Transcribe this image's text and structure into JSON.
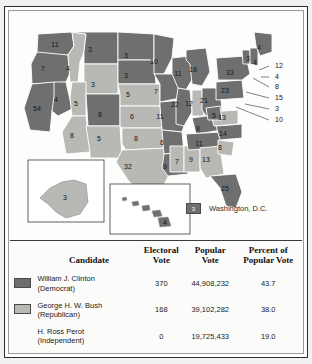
{
  "map": {
    "title": "1992 United States presidential election results map",
    "colors": {
      "democrat": "#6f6f6f",
      "republican": "#b8b8b4",
      "border": "#ffffff",
      "outline": "#6b6b6b",
      "background": "#fdfdfc"
    },
    "legend": {
      "swatch_value": "3",
      "label": "Washington, D.C.",
      "party": "democrat"
    },
    "insets": [
      {
        "name": "alaska",
        "value": "3",
        "party": "republican"
      },
      {
        "name": "hawaii",
        "value": "4",
        "party": "democrat"
      }
    ],
    "states": [
      {
        "code": "WA",
        "value": "11",
        "party": "democrat",
        "x": 45,
        "y": 33
      },
      {
        "code": "OR",
        "value": "7",
        "party": "democrat",
        "x": 33,
        "y": 57
      },
      {
        "code": "CA",
        "value": "54",
        "party": "democrat",
        "x": 27,
        "y": 97
      },
      {
        "code": "NV",
        "value": "4",
        "party": "democrat",
        "x": 46,
        "y": 88
      },
      {
        "code": "ID",
        "value": "4",
        "party": "republican",
        "x": 58,
        "y": 57
      },
      {
        "code": "MT",
        "value": "3",
        "party": "democrat",
        "x": 80,
        "y": 38
      },
      {
        "code": "WY",
        "value": "3",
        "party": "republican",
        "x": 83,
        "y": 73
      },
      {
        "code": "UT",
        "value": "5",
        "party": "republican",
        "x": 66,
        "y": 92
      },
      {
        "code": "AZ",
        "value": "8",
        "party": "republican",
        "x": 62,
        "y": 124
      },
      {
        "code": "CO",
        "value": "8",
        "party": "democrat",
        "x": 90,
        "y": 103
      },
      {
        "code": "NM",
        "value": "5",
        "party": "republican",
        "x": 89,
        "y": 127
      },
      {
        "code": "ND",
        "value": "3",
        "party": "democrat",
        "x": 116,
        "y": 44
      },
      {
        "code": "SD",
        "value": "3",
        "party": "democrat",
        "x": 116,
        "y": 64
      },
      {
        "code": "NE",
        "value": "5",
        "party": "republican",
        "x": 118,
        "y": 83
      },
      {
        "code": "KS",
        "value": "6",
        "party": "republican",
        "x": 122,
        "y": 105
      },
      {
        "code": "OK",
        "value": "8",
        "party": "republican",
        "x": 126,
        "y": 127
      },
      {
        "code": "TX",
        "value": "32",
        "party": "republican",
        "x": 118,
        "y": 155
      },
      {
        "code": "MN",
        "value": "10",
        "party": "democrat",
        "x": 144,
        "y": 50
      },
      {
        "code": "IA",
        "value": "7",
        "party": "democrat",
        "x": 146,
        "y": 80
      },
      {
        "code": "MO",
        "value": "11",
        "party": "democrat",
        "x": 150,
        "y": 105
      },
      {
        "code": "AR",
        "value": "6",
        "party": "democrat",
        "x": 152,
        "y": 131
      },
      {
        "code": "LA",
        "value": "9",
        "party": "democrat",
        "x": 155,
        "y": 155
      },
      {
        "code": "WI",
        "value": "11",
        "party": "democrat",
        "x": 168,
        "y": 62
      },
      {
        "code": "IL",
        "value": "22",
        "party": "democrat",
        "x": 165,
        "y": 93
      },
      {
        "code": "MS",
        "value": "7",
        "party": "republican",
        "x": 167,
        "y": 150
      },
      {
        "code": "AL",
        "value": "9",
        "party": "republican",
        "x": 181,
        "y": 148
      },
      {
        "code": "MI",
        "value": "18",
        "party": "democrat",
        "x": 183,
        "y": 58
      },
      {
        "code": "IN",
        "value": "12",
        "party": "republican",
        "x": 179,
        "y": 92
      },
      {
        "code": "OH",
        "value": "21",
        "party": "democrat",
        "x": 194,
        "y": 89
      },
      {
        "code": "KY",
        "value": "8",
        "party": "democrat",
        "x": 188,
        "y": 117
      },
      {
        "code": "TN",
        "value": "11",
        "party": "democrat",
        "x": 189,
        "y": 132
      },
      {
        "code": "GA",
        "value": "13",
        "party": "republican",
        "x": 196,
        "y": 148
      },
      {
        "code": "FL",
        "value": "25",
        "party": "democrat",
        "x": 215,
        "y": 177
      },
      {
        "code": "SC",
        "value": "8",
        "party": "republican",
        "x": 210,
        "y": 136
      },
      {
        "code": "NC",
        "value": "14",
        "party": "democrat",
        "x": 213,
        "y": 122
      },
      {
        "code": "VA",
        "value": "13",
        "party": "republican",
        "x": 212,
        "y": 106
      },
      {
        "code": "WV",
        "value": "5",
        "party": "democrat",
        "x": 204,
        "y": 104
      },
      {
        "code": "PA",
        "value": "23",
        "party": "democrat",
        "x": 215,
        "y": 79
      },
      {
        "code": "NY",
        "value": "33",
        "party": "democrat",
        "x": 220,
        "y": 61
      },
      {
        "code": "VT",
        "value": "3",
        "party": "democrat",
        "x": 238,
        "y": 47
      },
      {
        "code": "NH",
        "value": "4",
        "party": "democrat",
        "x": 245,
        "y": 51
      },
      {
        "code": "ME",
        "value": "4",
        "party": "democrat",
        "x": 249,
        "y": 36
      }
    ],
    "leader_labels": [
      {
        "code": "MA",
        "value": "12",
        "x": 265,
        "y": 54
      },
      {
        "code": "RI",
        "value": "4",
        "x": 265,
        "y": 65
      },
      {
        "code": "CT",
        "value": "8",
        "x": 265,
        "y": 75
      },
      {
        "code": "NJ",
        "value": "15",
        "x": 265,
        "y": 86
      },
      {
        "code": "DE",
        "value": "3",
        "x": 265,
        "y": 97
      },
      {
        "code": "MD",
        "value": "10",
        "x": 265,
        "y": 108
      }
    ]
  },
  "table": {
    "headers": {
      "candidate": "Candidate",
      "electoral_vote": "Electoral\nVote",
      "electoral_vote_line1": "Electoral",
      "electoral_vote_line2": "Vote",
      "popular_vote_line1": "Popular",
      "popular_vote_line2": "Vote",
      "percent_line1": "Percent of",
      "percent_line2": "Popular Vote"
    },
    "rows": [
      {
        "swatch": "democrat",
        "name": "William J. Clinton",
        "party": "(Democrat)",
        "electoral_vote": "370",
        "popular_vote": "44,908,232",
        "percent": "43.7"
      },
      {
        "swatch": "republican",
        "name": "George H. W. Bush",
        "party": "(Republican)",
        "electoral_vote": "168",
        "popular_vote": "39,102,282",
        "percent": "38.0"
      },
      {
        "swatch": "none",
        "name": "H. Ross Perot",
        "party": "(Independent)",
        "electoral_vote": "0",
        "popular_vote": "19,725,433",
        "percent": "19.0"
      }
    ]
  }
}
